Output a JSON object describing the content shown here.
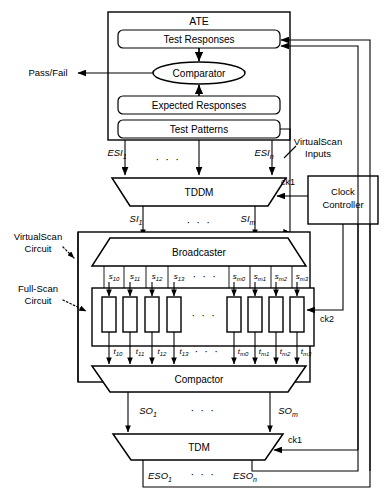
{
  "diagram": {
    "ate": {
      "label": "ATE",
      "blocks": [
        {
          "name": "test-responses",
          "label": "Test Responses"
        },
        {
          "name": "comparator",
          "label": "Comparator"
        },
        {
          "name": "expected-responses",
          "label": "Expected Responses"
        },
        {
          "name": "test-patterns",
          "label": "Test Patterns"
        }
      ]
    },
    "outputs": {
      "pass_fail": "Pass/Fail"
    },
    "annotations": {
      "virtualscan_inputs_line1": "VirtualScan",
      "virtualscan_inputs_line2": "Inputs",
      "virtualscan_circuit_line1": "VirtualScan",
      "virtualscan_circuit_line2": "Circuit",
      "fullscan_circuit_line1": "Full-Scan",
      "fullscan_circuit_line2": "Circuit"
    },
    "units": {
      "tddm": "TDDM",
      "broadcaster": "Broadcaster",
      "compactor": "Compactor",
      "tdm": "TDM",
      "clock_controller_line1": "Clock",
      "clock_controller_line2": "Controller"
    },
    "clocks": {
      "ck1_top": "ck1",
      "ck1_bottom": "ck1",
      "ck2": "ck2"
    },
    "ellipsis": "· · ·",
    "signals": {
      "esi": [
        {
          "base": "ESI",
          "sub": "1"
        },
        {
          "base": "ESI",
          "sub": "n"
        }
      ],
      "si": [
        {
          "base": "SI",
          "sub": "1"
        },
        {
          "base": "SI",
          "sub": "m"
        }
      ],
      "so": [
        {
          "base": "SO",
          "sub": "1"
        },
        {
          "base": "SO",
          "sub": "m"
        }
      ],
      "eso": [
        {
          "base": "ESO",
          "sub": "1"
        },
        {
          "base": "ESO",
          "sub": "n"
        }
      ],
      "s_left": [
        {
          "base": "s",
          "sub": "10"
        },
        {
          "base": "s",
          "sub": "11"
        },
        {
          "base": "s",
          "sub": "12"
        },
        {
          "base": "s",
          "sub": "13"
        }
      ],
      "s_right": [
        {
          "base": "s",
          "sub": "m0"
        },
        {
          "base": "s",
          "sub": "m1"
        },
        {
          "base": "s",
          "sub": "m2"
        },
        {
          "base": "s",
          "sub": "m3"
        }
      ],
      "t_left": [
        {
          "base": "t",
          "sub": "10"
        },
        {
          "base": "t",
          "sub": "11"
        },
        {
          "base": "t",
          "sub": "12"
        },
        {
          "base": "t",
          "sub": "13"
        }
      ],
      "t_right": [
        {
          "base": "t",
          "sub": "m0"
        },
        {
          "base": "t",
          "sub": "m1"
        },
        {
          "base": "t",
          "sub": "m2"
        },
        {
          "base": "t",
          "sub": "m3"
        }
      ]
    },
    "scan_chain_count": 8,
    "colors": {
      "line": "#000000",
      "background": "#ffffff"
    }
  }
}
